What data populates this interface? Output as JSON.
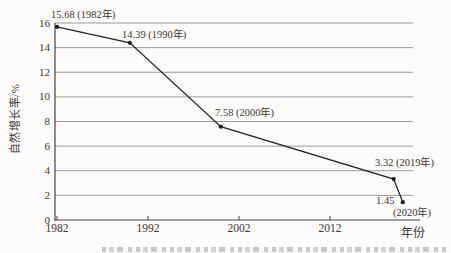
{
  "figure": {
    "background": "#fcfbfa"
  },
  "chart_data": {
    "type": "line",
    "title": "",
    "xlabel": "年份",
    "ylabel": "自然增长率/%",
    "x_ticks": [
      1982,
      1992,
      2002,
      2012
    ],
    "y_ticks": [
      0,
      2,
      4,
      6,
      8,
      10,
      12,
      14,
      16
    ],
    "ylim": [
      0,
      16
    ],
    "xlim": [
      1982,
      2021
    ],
    "grid": "horizontal",
    "legend": "none",
    "series": [
      {
        "name": "natural-growth-rate",
        "points": [
          {
            "x": 1982,
            "y": 15.68,
            "label": "15.68 (1982年)"
          },
          {
            "x": 1990,
            "y": 14.39,
            "label": "14.39 (1990年)"
          },
          {
            "x": 2000,
            "y": 7.58,
            "label": "7.58 (2000年)"
          },
          {
            "x": 2019,
            "y": 3.32,
            "label": "3.32 (2019年)"
          },
          {
            "x": 2020,
            "y": 1.45,
            "label": "1.45",
            "label_sub": "(2020年)"
          }
        ]
      }
    ],
    "colors": {
      "line": "#272523",
      "marker": "#1e1c1a",
      "grid": "#9a9a98",
      "axis": "#44413e",
      "text": "#3b3734"
    }
  }
}
